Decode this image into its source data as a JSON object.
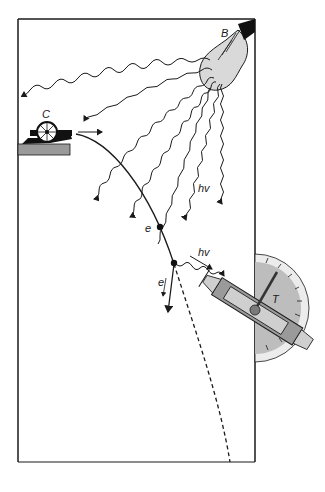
{
  "diagram": {
    "type": "physics thought-experiment illustration",
    "labels": {
      "bulb": "B",
      "cannon": "C",
      "detector": "T",
      "photon_1": "hv",
      "photon_2": "hv",
      "electron_1": "e",
      "electron_2": "e"
    },
    "colors": {
      "stroke": "#1a1a1a",
      "bulb_fill": "#d9d9d9",
      "gauge_fill": "#bdbdbd",
      "gauge_rim": "#ececec",
      "platform_fill": "#9a9a9a",
      "background": "#ffffff"
    },
    "components": [
      {
        "id": "box",
        "description": "rectangular enclosure, open at bottom right"
      },
      {
        "id": "bulb",
        "label": "B",
        "description": "light bulb in top-right corner emitting wavy photon rays"
      },
      {
        "id": "cannon",
        "label": "C",
        "description": "electron cannon on grey platform at left"
      },
      {
        "id": "trajectory",
        "description": "curved electron path, solid then dashed after deflection"
      },
      {
        "id": "detector",
        "label": "T",
        "description": "telescope/detector with semicircular gauge at right edge"
      }
    ]
  }
}
